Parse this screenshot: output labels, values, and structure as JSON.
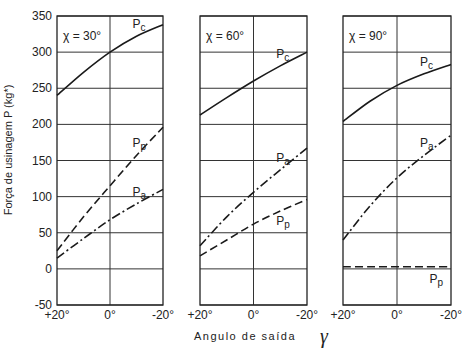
{
  "chart_data": {
    "type": "line",
    "ylabel": "Força de usinagem  P (kg*)",
    "xlabel": "Angulo de saída",
    "xlabel_symbol": "γ",
    "ylim": [
      -50,
      350
    ],
    "yticks": [
      350,
      300,
      250,
      200,
      150,
      100,
      50,
      0,
      -50
    ],
    "xlim": [
      20,
      -20
    ],
    "xticks": [
      20,
      0,
      -20
    ],
    "xtick_labels": [
      "+20°",
      "0°",
      "-20°"
    ],
    "grid": true,
    "panels": [
      {
        "title": "χ = 30°",
        "series": [
          {
            "name": "Pc",
            "style": "solid",
            "x": [
              20,
              10,
              0,
              -10,
              -20
            ],
            "values": [
              240,
              272,
              300,
              322,
              338
            ]
          },
          {
            "name": "Pp",
            "style": "dashed",
            "x": [
              20,
              10,
              0,
              -10,
              -20
            ],
            "values": [
              25,
              72,
              115,
              157,
              196
            ]
          },
          {
            "name": "Pa",
            "style": "dashdot",
            "x": [
              20,
              10,
              0,
              -10,
              -20
            ],
            "values": [
              15,
              42,
              68,
              90,
              110
            ]
          }
        ]
      },
      {
        "title": "χ = 60°",
        "series": [
          {
            "name": "Pc",
            "style": "solid",
            "x": [
              20,
              10,
              0,
              -10,
              -20
            ],
            "values": [
              213,
              237,
              260,
              281,
              300
            ]
          },
          {
            "name": "Pa",
            "style": "dashdot",
            "x": [
              20,
              10,
              0,
              -10,
              -20
            ],
            "values": [
              32,
              72,
              106,
              137,
              167
            ]
          },
          {
            "name": "Pp",
            "style": "dashed",
            "x": [
              20,
              10,
              0,
              -10,
              -20
            ],
            "values": [
              18,
              40,
              62,
              80,
              96
            ]
          }
        ]
      },
      {
        "title": "χ = 90°",
        "series": [
          {
            "name": "Pc",
            "style": "solid",
            "x": [
              20,
              10,
              0,
              -10,
              -20
            ],
            "values": [
              204,
              232,
              254,
              270,
              283
            ]
          },
          {
            "name": "Pa",
            "style": "dashdot",
            "x": [
              20,
              10,
              0,
              -10,
              -20
            ],
            "values": [
              40,
              87,
              126,
              157,
              185
            ]
          },
          {
            "name": "Pp",
            "style": "dashed",
            "x": [
              20,
              10,
              0,
              -10,
              -20
            ],
            "values": [
              3,
              3,
              3,
              3,
              3
            ]
          }
        ]
      }
    ]
  }
}
